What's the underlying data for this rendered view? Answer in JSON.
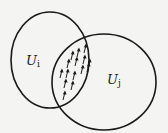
{
  "diagram": {
    "sets": [
      {
        "name": "U",
        "subscript": "i"
      },
      {
        "name": "U",
        "subscript": "j"
      }
    ],
    "intersection": {
      "content": "arrows",
      "arrow_count": 15,
      "arrow_direction": "up"
    },
    "colors": {
      "stroke": "#1a1a1a",
      "background": "#f4f4f2"
    }
  }
}
